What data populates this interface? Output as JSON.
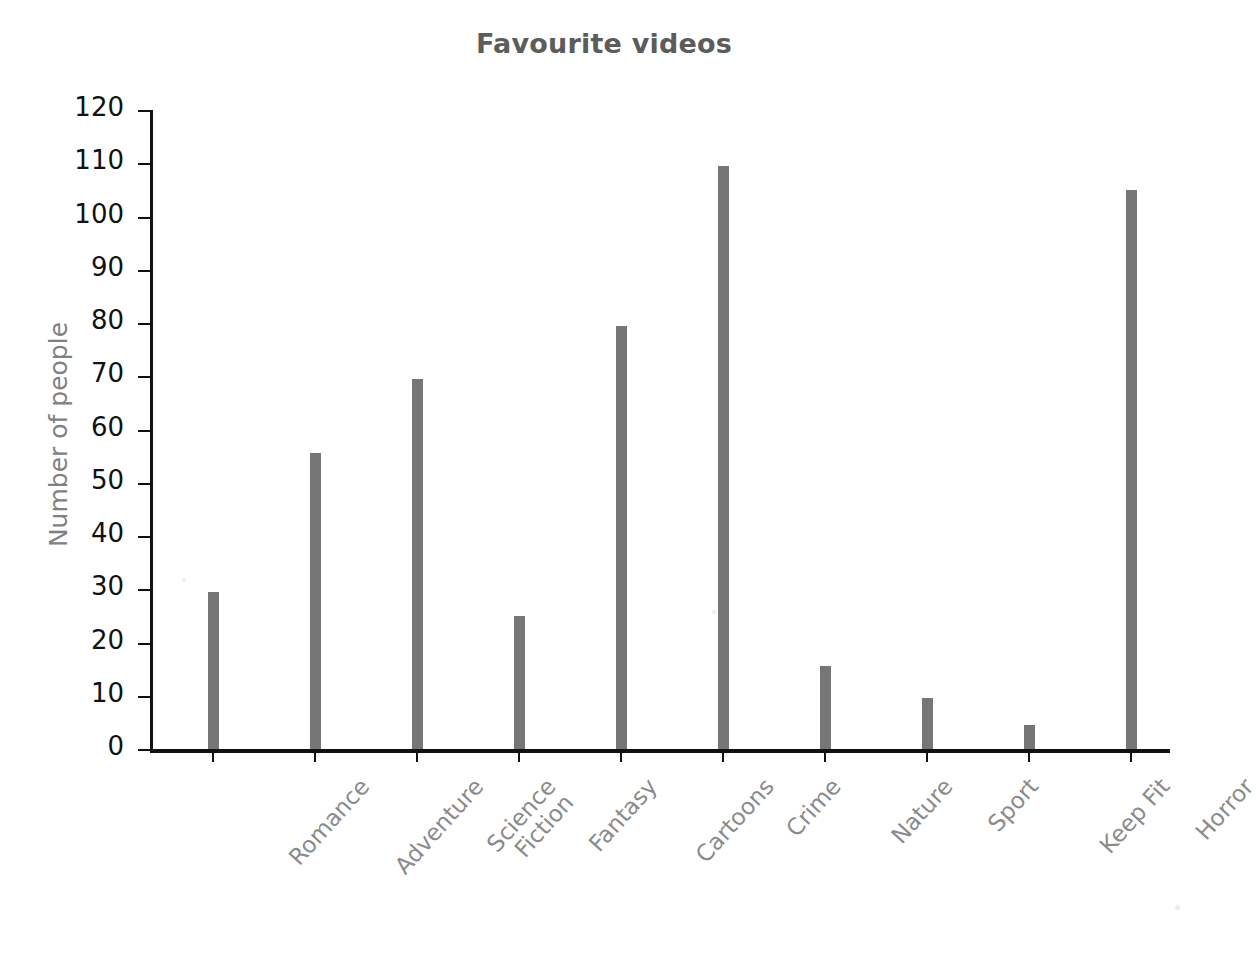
{
  "chart_data": {
    "type": "bar",
    "title": "Favourite videos",
    "xlabel": "",
    "ylabel": "Number of people",
    "categories": [
      "Romance",
      "Adventure",
      "Science Fiction",
      "Fantasy",
      "Cartoons",
      "Crime",
      "Nature",
      "Sport",
      "Keep Fit",
      "Horror"
    ],
    "category_lines": [
      [
        "Romance"
      ],
      [
        "Adventure"
      ],
      [
        "Science",
        "Fiction"
      ],
      [
        "Fantasy"
      ],
      [
        "Cartoons"
      ],
      [
        "Crime"
      ],
      [
        "Nature"
      ],
      [
        "Sport"
      ],
      [
        "Keep Fit"
      ],
      [
        "Horror"
      ]
    ],
    "values": [
      29.5,
      55.5,
      69.5,
      25,
      79.5,
      109.5,
      15.5,
      9.5,
      4.5,
      105
    ],
    "ylim": [
      0,
      120
    ],
    "ytick_step": 10,
    "ytick_labels": [
      "120",
      "110",
      "100",
      "90",
      "80",
      "70",
      "60",
      "50",
      "40",
      "30",
      "20",
      "10",
      "0"
    ],
    "grid": false,
    "legend": null,
    "bar_color": "#767676",
    "axis_color": "#111111",
    "title_color": "#5c5c5c",
    "label_color": "#8a8a8a"
  }
}
